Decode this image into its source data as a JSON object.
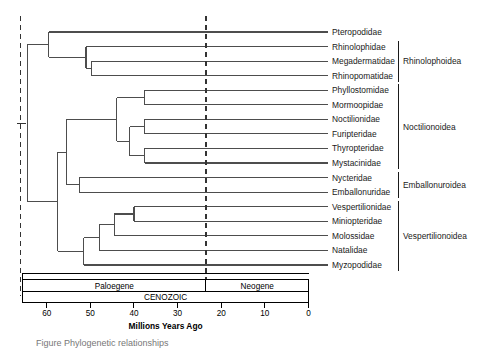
{
  "figure": {
    "caption_fragment": "Figure      Phylogenetic relationships"
  },
  "chart_data": {
    "type": "tree",
    "title": "",
    "xlabel": "Millions Years Ago",
    "axis": {
      "ticks": [
        60,
        50,
        40,
        30,
        20,
        10,
        0
      ],
      "tick_labels": [
        "60",
        "50",
        "40",
        "30",
        "20",
        "10",
        "0"
      ],
      "xlim": [
        65,
        0
      ],
      "direction": "reversed",
      "unit": "Ma"
    },
    "reference_lines": [
      {
        "name": "root-marker-line",
        "age": 66,
        "style": "dashed"
      },
      {
        "name": "paleogene-neogene-boundary",
        "age": 23.5,
        "style": "dashed"
      }
    ],
    "timescale": {
      "era": {
        "label": "CENOZOIC",
        "start": 65.5,
        "end": 0
      },
      "periods": [
        {
          "label": "Paloegene",
          "start": 65.5,
          "end": 23.5
        },
        {
          "label": "Neogene",
          "start": 23.5,
          "end": 0
        }
      ]
    },
    "tips": [
      {
        "label": "Pteropodidae",
        "divergence_age": 63.8,
        "superfamily": ""
      },
      {
        "label": "Rhinolophidae",
        "divergence_age": 55.5,
        "superfamily": "Rhinolophoidea"
      },
      {
        "label": "Megadermatidae",
        "divergence_age": 54.4,
        "superfamily": "Rhinolophoidea"
      },
      {
        "label": "Rhinopomatidae",
        "divergence_age": 54.4,
        "superfamily": "Rhinolophoidea"
      },
      {
        "label": "Phyllostomidae",
        "divergence_age": 48.0,
        "superfamily": "Noctilionoidea"
      },
      {
        "label": "Mormoopidae",
        "divergence_age": 48.0,
        "superfamily": "Noctilionoidea"
      },
      {
        "label": "Noctilionidae",
        "divergence_age": 48.0,
        "superfamily": "Noctilionoidea"
      },
      {
        "label": "Furipteridae",
        "divergence_age": 48.0,
        "superfamily": "Noctilionoidea"
      },
      {
        "label": "Thyropteridae",
        "divergence_age": 48.0,
        "superfamily": "Noctilionoidea"
      },
      {
        "label": "Mystacinidae",
        "divergence_age": 48.0,
        "superfamily": "Noctilionoidea"
      },
      {
        "label": "Nycteridae",
        "divergence_age": 55.0,
        "superfamily": "Emballonuroidea"
      },
      {
        "label": "Emballonuridae",
        "divergence_age": 55.0,
        "superfamily": "Emballonuroidea"
      },
      {
        "label": "Vespertilionidae",
        "divergence_age": 40.0,
        "superfamily": "Vespertilionoidea"
      },
      {
        "label": "Miniopteridae",
        "divergence_age": 40.0,
        "superfamily": "Vespertilionoidea"
      },
      {
        "label": "Molossidae",
        "divergence_age": 44.5,
        "superfamily": "Vespertilionoidea"
      },
      {
        "label": "Natalidae",
        "divergence_age": 48.0,
        "superfamily": "Vespertilionoidea"
      },
      {
        "label": "Myzopodidae",
        "divergence_age": 51.5,
        "superfamily": "Vespertilionoidea"
      }
    ],
    "nodes": [
      {
        "name": "root",
        "age": 64.5
      },
      {
        "name": "pteropodidae-rhinolophoidea-split",
        "age": 59.5
      },
      {
        "name": "rhinolophoidea-crown",
        "age": 51.0
      },
      {
        "name": "megadermatidae-rhinopomatidae",
        "age": 49.8
      },
      {
        "name": "yangochiroptera-crown",
        "age": 57.5
      },
      {
        "name": "noctilionoidea-emballonuroidea",
        "age": 55.5
      },
      {
        "name": "noctilionoidea-crown",
        "age": 44.0
      },
      {
        "name": "phyllostomidae-mormoopidae",
        "age": 37.5
      },
      {
        "name": "noctilionidae-clade",
        "age": 41.0
      },
      {
        "name": "noctilionidae-furipteridae",
        "age": 37.5
      },
      {
        "name": "thyropteridae-mystacinidae",
        "age": 37.5
      },
      {
        "name": "emballonuroidea-crown",
        "age": 52.5
      },
      {
        "name": "vespertilionoidea-crown",
        "age": 51.5
      },
      {
        "name": "natalidae-clade",
        "age": 48.0
      },
      {
        "name": "molossidae-clade",
        "age": 44.5
      },
      {
        "name": "vespertilionidae-miniopteridae",
        "age": 40.0
      }
    ],
    "clade_brackets": [
      {
        "label": "Rhinolophoidea",
        "first_tip": "Rhinolophidae",
        "last_tip": "Rhinopomatidae"
      },
      {
        "label": "Noctilionoidea",
        "first_tip": "Phyllostomidae",
        "last_tip": "Mystacinidae"
      },
      {
        "label": "Emballonuroidea",
        "first_tip": "Nycteridae",
        "last_tip": "Emballonuridae"
      },
      {
        "label": "Vespertilionoidea",
        "first_tip": "Vespertilionidae",
        "last_tip": "Myzopodidae"
      }
    ],
    "colors": {
      "branch": "#4d4d4d",
      "text": "#1a1a1a",
      "axis": "#000000",
      "dashed_line": "#333333"
    }
  }
}
